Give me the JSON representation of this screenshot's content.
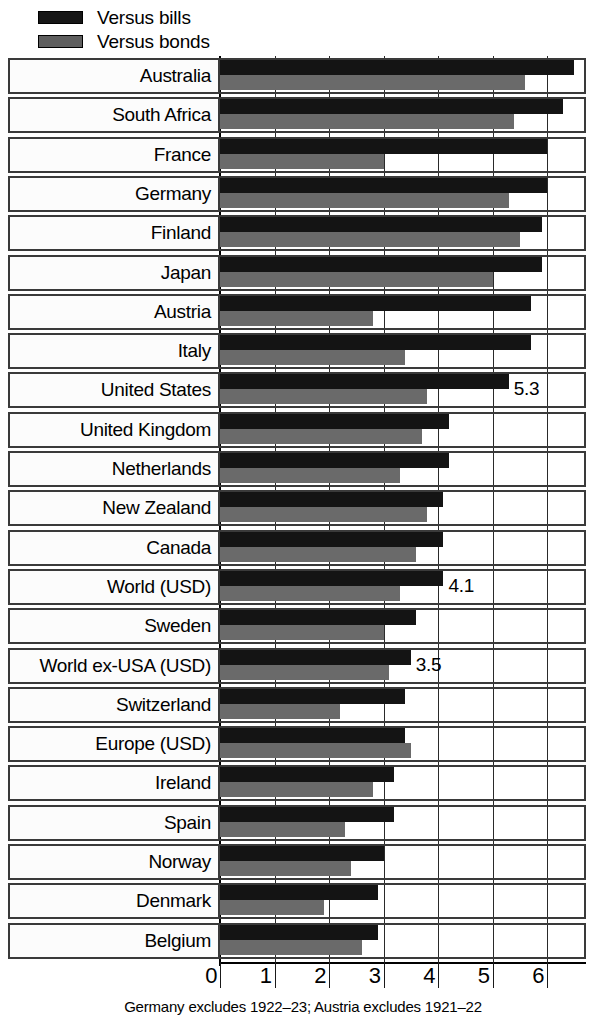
{
  "legend": {
    "items": [
      {
        "label": "Versus bills",
        "key": "bills",
        "color": "#141414",
        "icon": "legend-swatch-black"
      },
      {
        "label": "Versus bonds",
        "key": "bonds",
        "color": "#6a6a6a",
        "icon": "legend-swatch-gray"
      }
    ]
  },
  "footnote": "Germany excludes 1922–23; Austria excludes 1921–22",
  "axis": {
    "ticks": [
      "0",
      "1",
      "2",
      "3",
      "4",
      "5",
      "6"
    ],
    "min": 0,
    "max": 6.7
  },
  "chart_data": {
    "type": "bar",
    "orientation": "horizontal",
    "title": "",
    "subtitle": "",
    "xlabel": "",
    "ylabel": "",
    "xlim": [
      0,
      6.7
    ],
    "grid": true,
    "legend_position": "top-left",
    "note": "Germany excludes 1922–23; Austria excludes 1921–22",
    "categories": [
      "Australia",
      "South Africa",
      "France",
      "Germany",
      "Finland",
      "Japan",
      "Austria",
      "Italy",
      "United States",
      "United Kingdom",
      "Netherlands",
      "New Zealand",
      "Canada",
      "World (USD)",
      "Sweden",
      "World ex-USA (USD)",
      "Switzerland",
      "Europe (USD)",
      "Ireland",
      "Spain",
      "Norway",
      "Denmark",
      "Belgium"
    ],
    "series": [
      {
        "name": "Versus bills",
        "color": "#141414",
        "values": [
          6.5,
          6.3,
          6.0,
          6.0,
          5.9,
          5.9,
          5.7,
          5.7,
          5.3,
          4.2,
          4.2,
          4.1,
          4.1,
          4.1,
          3.6,
          3.5,
          3.4,
          3.4,
          3.2,
          3.2,
          3.0,
          2.9,
          2.9
        ]
      },
      {
        "name": "Versus bonds",
        "color": "#6a6a6a",
        "values": [
          5.6,
          5.4,
          3.0,
          5.3,
          5.5,
          5.0,
          2.8,
          3.4,
          3.8,
          3.7,
          3.3,
          3.8,
          3.6,
          3.3,
          3.0,
          3.1,
          2.2,
          3.5,
          2.8,
          2.3,
          2.4,
          1.9,
          2.6
        ]
      }
    ],
    "data_labels": {
      "United States": "5.3",
      "World (USD)": "4.1",
      "World ex-USA (USD)": "3.5"
    }
  }
}
